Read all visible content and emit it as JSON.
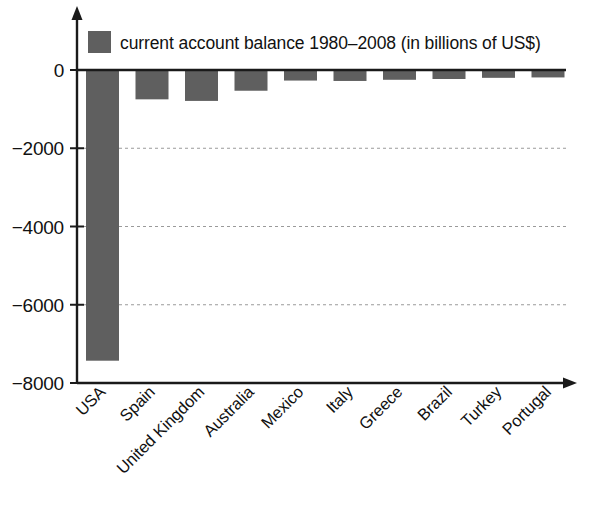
{
  "chart_data": {
    "type": "bar",
    "title": "",
    "subtitle": "",
    "xlabel": "",
    "ylabel": "",
    "legend": [
      "current account balance 1980–2008 (in billions of US$)"
    ],
    "legend_position": "top-left-inside",
    "grid": "horizontal-dotted",
    "ylim": [
      -8000,
      0
    ],
    "yticks": [
      0,
      -2000,
      -4000,
      -6000,
      -8000
    ],
    "ytick_labels": [
      "0",
      "−2000",
      "−4000",
      "−6000",
      "−8000"
    ],
    "gridlines_at": [
      -2000,
      -4000,
      -6000
    ],
    "categories": [
      "USA",
      "Spain",
      "United Kingdom",
      "Australia",
      "Mexico",
      "Italy",
      "Greece",
      "Brazil",
      "Turkey",
      "Portugal"
    ],
    "series": [
      {
        "name": "current account balance 1980–2008 (in billions of US$)",
        "color": "#5f5f5f",
        "values": [
          -7430,
          -750,
          -790,
          -530,
          -270,
          -280,
          -250,
          -230,
          -200,
          -190
        ]
      }
    ],
    "x_label_rotation_deg": -45,
    "axis_style": "arrowed-L"
  },
  "legend": {
    "swatch_color": "#5f5f5f",
    "text": "current account balance 1980–2008 (in billions of US$)"
  },
  "axes": {
    "y_ticks": [
      {
        "label": "0",
        "value": 0
      },
      {
        "label": "−2000",
        "value": -2000
      },
      {
        "label": "−4000",
        "value": -4000
      },
      {
        "label": "−6000",
        "value": -6000
      },
      {
        "label": "−8000",
        "value": -8000
      }
    ],
    "x_categories": [
      {
        "label": "USA"
      },
      {
        "label": "Spain"
      },
      {
        "label": "United Kingdom"
      },
      {
        "label": "Australia"
      },
      {
        "label": "Mexico"
      },
      {
        "label": "Italy"
      },
      {
        "label": "Greece"
      },
      {
        "label": "Brazil"
      },
      {
        "label": "Turkey"
      },
      {
        "label": "Portugal"
      }
    ]
  }
}
